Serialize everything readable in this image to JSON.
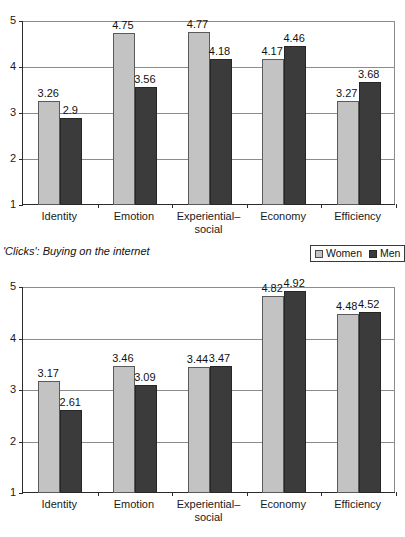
{
  "caption": "'Clicks': Buying on the internet",
  "legend": {
    "position": "below-top-chart-right",
    "entries": [
      {
        "label": "Women",
        "color": "#c3c3c3",
        "swatch": "women-swatch-icon"
      },
      {
        "label": "Men",
        "color": "#3b3b3b",
        "swatch": "men-swatch-icon"
      }
    ]
  },
  "chart_data": [
    {
      "id": "top",
      "type": "bar",
      "title": "",
      "xlabel": "",
      "ylabel": "",
      "ylim": [
        1,
        5
      ],
      "yticks": [
        "1",
        "2",
        "3",
        "4",
        "5"
      ],
      "grid": true,
      "legend_position": "bottom-right",
      "categories": [
        "Identity",
        "Emotion",
        "Experiential–\nsocial",
        "Economy",
        "Efficiency"
      ],
      "series": [
        {
          "name": "Women",
          "color": "#c3c3c3",
          "values": [
            3.26,
            4.75,
            4.77,
            4.17,
            3.27
          ],
          "labels": [
            "3.26",
            "4.75",
            "4.77",
            "4.17",
            "3.27"
          ]
        },
        {
          "name": "Men",
          "color": "#3b3b3b",
          "values": [
            2.9,
            3.56,
            4.18,
            4.46,
            3.68
          ],
          "labels": [
            "2.9",
            "3.56",
            "4.18",
            "4.46",
            "3.68"
          ]
        }
      ]
    },
    {
      "id": "bottom",
      "type": "bar",
      "title": "",
      "xlabel": "",
      "ylabel": "",
      "ylim": [
        1,
        5
      ],
      "yticks": [
        "1",
        "2",
        "3",
        "4",
        "5"
      ],
      "grid": true,
      "legend_position": "none",
      "categories": [
        "Identity",
        "Emotion",
        "Experiential–\nsocial",
        "Economy",
        "Efficiency"
      ],
      "series": [
        {
          "name": "Women",
          "color": "#c3c3c3",
          "values": [
            3.17,
            3.46,
            3.44,
            4.82,
            4.48
          ],
          "labels": [
            "3.17",
            "3.46",
            "3.44",
            "4.82",
            "4.48"
          ]
        },
        {
          "name": "Men",
          "color": "#3b3b3b",
          "values": [
            2.61,
            3.09,
            3.47,
            4.92,
            4.52
          ],
          "labels": [
            "2.61",
            "3.09",
            "3.47",
            "4.92",
            "4.52"
          ]
        }
      ]
    }
  ]
}
